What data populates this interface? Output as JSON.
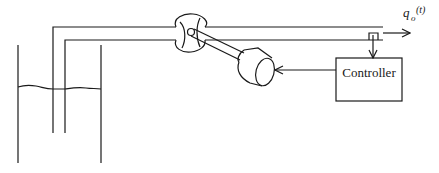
{
  "diagram": {
    "type": "process-control-schematic",
    "labels": {
      "controller": "Controller",
      "output_flow_var": "q",
      "output_flow_sub": "o",
      "output_flow_arg": "(t)"
    },
    "components": [
      {
        "id": "tank",
        "label": ""
      },
      {
        "id": "liquid-level",
        "label": ""
      },
      {
        "id": "outlet-pipe",
        "label": ""
      },
      {
        "id": "control-valve",
        "label": ""
      },
      {
        "id": "actuator-motor",
        "label": ""
      },
      {
        "id": "flow-sensor",
        "label": ""
      },
      {
        "id": "controller",
        "label": "Controller"
      }
    ],
    "connections": [
      {
        "from": "flow-sensor",
        "to": "controller",
        "type": "arrow"
      },
      {
        "from": "controller",
        "to": "actuator-motor",
        "type": "arrow"
      },
      {
        "from": "outlet-pipe",
        "to": "output",
        "type": "arrow",
        "label": "q_o(t)"
      }
    ],
    "colors": {
      "stroke": "#1a1a1a",
      "background": "#ffffff"
    }
  }
}
